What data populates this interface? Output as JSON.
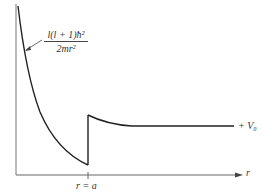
{
  "diagram": {
    "type": "potential-energy-curve",
    "annotation": {
      "numerator": "l(l + 1)ħ²",
      "denominator": "2mr²"
    },
    "x_axis_label": "r",
    "tick_label": "r = a",
    "level_label": "+ V₀",
    "colors": {
      "line": "#222222",
      "axis": "#555555",
      "text": "#333333"
    }
  }
}
